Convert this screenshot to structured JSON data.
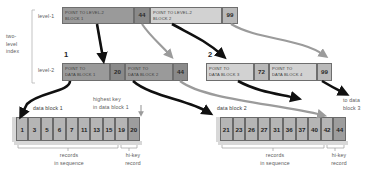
{
  "figure": {
    "side_label": "two-\nlevel\nindex",
    "level1_label": "level-1",
    "level2_label": "level-2"
  },
  "colors": {
    "dark_cell": "#9a9a9a",
    "light_cell": "#d2d2d2",
    "key_dark": "#8a8a8a",
    "key_light": "#b9b9b9",
    "record": "#b5b5b5",
    "hikey_record": "#9d9d9d",
    "arrow_black": "#101010",
    "arrow_gray": "#9b9b9b",
    "border": "#6e6e6e",
    "text": "#3d3d3d",
    "label_text": "#5c5c5c"
  },
  "level1": {
    "entries": [
      {
        "pointer": "POINT TO LEVEL-2\nBLOCK 1",
        "key": "44",
        "shade": "dark"
      },
      {
        "pointer": "POINT TO LEVEL-2\nBLOCK 2",
        "key": "99",
        "shade": "light"
      }
    ]
  },
  "level2": {
    "block_numbers": [
      "1",
      "2"
    ],
    "blocks": [
      {
        "number": "1",
        "entries": [
          {
            "pointer": "POINT TO\nDATA BLOCK 1",
            "key": "20",
            "shade": "dark"
          },
          {
            "pointer": "POINT TO\nDATA BLOCK 2",
            "key": "44",
            "shade": "light"
          }
        ]
      },
      {
        "number": "2",
        "entries": [
          {
            "pointer": "POINT TO\nDATA BLOCK 3",
            "key": "72",
            "shade": "light"
          },
          {
            "pointer": "POINT TO\nDATA BLOCK 4",
            "key": "99",
            "shade": "light"
          }
        ]
      }
    ]
  },
  "data_blocks": [
    {
      "caption": "data block 1",
      "records": [
        "1",
        "3",
        "5",
        "6",
        "7",
        "11",
        "13",
        "15",
        "19"
      ],
      "hi_key": "20",
      "records_label": "records\nin sequence",
      "hikey_label": "hi-key\nrecord"
    },
    {
      "caption": "data block 2",
      "records": [
        "21",
        "23",
        "26",
        "27",
        "31",
        "36",
        "37",
        "40",
        "42"
      ],
      "hi_key": "44",
      "records_label": "records\nin sequence",
      "hikey_label": "hi-key\nrecord"
    }
  ],
  "annotations": {
    "highest_key": "highest key\nin data block 1",
    "to_data_block3": "to data\nblock 3"
  }
}
